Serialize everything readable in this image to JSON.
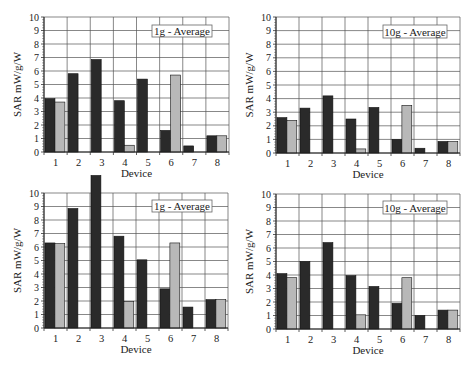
{
  "chart_data": [
    {
      "type": "bar",
      "title": "1g - Average",
      "legend": "1g - Average",
      "xlabel": "Device",
      "ylabel": "SAR mW/g/W",
      "ylim": [
        0,
        10
      ],
      "yticks": [
        0,
        1,
        2,
        3,
        4,
        5,
        6,
        7,
        8,
        9,
        10
      ],
      "grid": true,
      "categories": [
        "1",
        "2",
        "3",
        "4",
        "5",
        "6",
        "7",
        "8"
      ],
      "series": [
        {
          "name": "dark",
          "color": "#2a2a2a",
          "values": [
            3.95,
            5.8,
            6.85,
            3.8,
            5.4,
            1.6,
            0.45,
            1.2
          ]
        },
        {
          "name": "light",
          "color": "#b8b8b8",
          "values": [
            3.7,
            0,
            0,
            0.5,
            0,
            5.7,
            0,
            1.2
          ]
        }
      ]
    },
    {
      "type": "bar",
      "title": "10g - Average",
      "legend": "10g - Average",
      "xlabel": "Device",
      "ylabel": "SAR mW/g/W",
      "ylim": [
        0,
        10
      ],
      "yticks": [
        0,
        1,
        2,
        3,
        4,
        5,
        6,
        7,
        8,
        9,
        10
      ],
      "grid": true,
      "categories": [
        "1",
        "2",
        "3",
        "4",
        "5",
        "6",
        "7",
        "8"
      ],
      "series": [
        {
          "name": "dark",
          "color": "#2a2a2a",
          "values": [
            2.6,
            3.3,
            4.2,
            2.5,
            3.35,
            1.0,
            0.35,
            0.85
          ]
        },
        {
          "name": "light",
          "color": "#b8b8b8",
          "values": [
            2.4,
            0,
            0,
            0.3,
            0,
            3.5,
            0,
            0.85
          ]
        }
      ]
    },
    {
      "type": "bar",
      "title": "1g - Average",
      "legend": "1g - Average",
      "xlabel": "Device",
      "ylabel": "SAR mW/g/W",
      "ylim": [
        0,
        10
      ],
      "yticks": [
        0,
        1,
        2,
        3,
        4,
        5,
        6,
        7,
        8,
        9,
        10
      ],
      "grid": true,
      "categories": [
        "1",
        "2",
        "3",
        "4",
        "5",
        "6",
        "7",
        "8"
      ],
      "series": [
        {
          "name": "dark",
          "color": "#2a2a2a",
          "values": [
            6.3,
            8.85,
            11.3,
            6.8,
            5.05,
            2.9,
            1.55,
            2.1
          ]
        },
        {
          "name": "light",
          "color": "#b8b8b8",
          "values": [
            6.25,
            0,
            0,
            1.95,
            0,
            6.3,
            0,
            2.1
          ]
        }
      ]
    },
    {
      "type": "bar",
      "title": "10g - Average",
      "legend": "10g - Average",
      "xlabel": "Device",
      "ylabel": "SAR mW/g/W",
      "ylim": [
        0,
        10
      ],
      "yticks": [
        0,
        1,
        2,
        3,
        4,
        5,
        6,
        7,
        8,
        9,
        10
      ],
      "grid": true,
      "categories": [
        "1",
        "2",
        "3",
        "4",
        "5",
        "6",
        "7",
        "8"
      ],
      "series": [
        {
          "name": "dark",
          "color": "#2a2a2a",
          "values": [
            4.1,
            5.0,
            6.4,
            3.95,
            3.15,
            1.9,
            1.0,
            1.4
          ]
        },
        {
          "name": "light",
          "color": "#b8b8b8",
          "values": [
            3.8,
            0,
            0,
            1.05,
            0,
            3.8,
            0,
            1.4
          ]
        }
      ]
    }
  ]
}
